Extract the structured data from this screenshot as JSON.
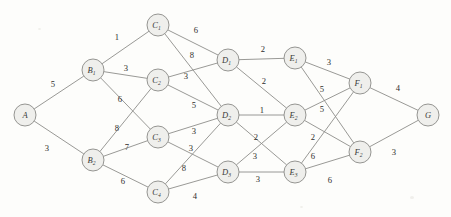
{
  "figure": {
    "background_color": "#fdfdfb",
    "node_fill_color": "#efefec",
    "node_stroke_color": "#8a8a87",
    "edge_color": "#8d8d8a",
    "label_color": "#2e2e2c",
    "width": 451,
    "height": 217
  },
  "chart_data": {
    "type": "diagram",
    "subtype": "weighted-undirected-graph",
    "title": "",
    "xlabel": "",
    "ylabel": "",
    "layers": [
      {
        "name": "source",
        "nodes": [
          "A"
        ]
      },
      {
        "name": "B",
        "nodes": [
          "B1",
          "B2"
        ]
      },
      {
        "name": "C",
        "nodes": [
          "C1",
          "C2",
          "C3",
          "C4"
        ]
      },
      {
        "name": "D",
        "nodes": [
          "D1",
          "D2",
          "D3"
        ]
      },
      {
        "name": "E",
        "nodes": [
          "E1",
          "E2",
          "E3"
        ]
      },
      {
        "name": "F",
        "nodes": [
          "F1",
          "F2"
        ]
      },
      {
        "name": "sink",
        "nodes": [
          "G"
        ]
      }
    ],
    "nodes": [
      {
        "id": "A",
        "base": "A",
        "sub": "",
        "x": 25,
        "y": 115,
        "r": 11
      },
      {
        "id": "B1",
        "base": "B",
        "sub": "1",
        "x": 93,
        "y": 70,
        "r": 11
      },
      {
        "id": "B2",
        "base": "B",
        "sub": "2",
        "x": 93,
        "y": 160,
        "r": 11
      },
      {
        "id": "C1",
        "base": "C",
        "sub": "1",
        "x": 158,
        "y": 25,
        "r": 11
      },
      {
        "id": "C2",
        "base": "C",
        "sub": "2",
        "x": 158,
        "y": 80,
        "r": 11
      },
      {
        "id": "C3",
        "base": "C",
        "sub": "3",
        "x": 158,
        "y": 137,
        "r": 11
      },
      {
        "id": "C4",
        "base": "C",
        "sub": "4",
        "x": 158,
        "y": 192,
        "r": 11
      },
      {
        "id": "D1",
        "base": "D",
        "sub": "1",
        "x": 228,
        "y": 60,
        "r": 11
      },
      {
        "id": "D2",
        "base": "D",
        "sub": "2",
        "x": 228,
        "y": 115,
        "r": 11
      },
      {
        "id": "D3",
        "base": "D",
        "sub": "3",
        "x": 228,
        "y": 172,
        "r": 11
      },
      {
        "id": "E1",
        "base": "E",
        "sub": "1",
        "x": 295,
        "y": 58,
        "r": 11
      },
      {
        "id": "E2",
        "base": "E",
        "sub": "2",
        "x": 295,
        "y": 115,
        "r": 11
      },
      {
        "id": "E3",
        "base": "E",
        "sub": "3",
        "x": 295,
        "y": 172,
        "r": 11
      },
      {
        "id": "F1",
        "base": "F",
        "sub": "1",
        "x": 360,
        "y": 83,
        "r": 11
      },
      {
        "id": "F2",
        "base": "F",
        "sub": "2",
        "x": 360,
        "y": 152,
        "r": 11
      },
      {
        "id": "G",
        "base": "G",
        "sub": "",
        "x": 428,
        "y": 115,
        "r": 11
      }
    ],
    "edges": [
      {
        "from": "A",
        "to": "B1",
        "weight": 5,
        "lx": 53,
        "ly": 84
      },
      {
        "from": "A",
        "to": "B2",
        "weight": 3,
        "lx": 47,
        "ly": 148
      },
      {
        "from": "B1",
        "to": "C1",
        "weight": 1,
        "lx": 117,
        "ly": 37
      },
      {
        "from": "B1",
        "to": "C2",
        "weight": 3,
        "lx": 126,
        "ly": 68
      },
      {
        "from": "B1",
        "to": "C3",
        "weight": 6,
        "lx": 120,
        "ly": 99
      },
      {
        "from": "B2",
        "to": "C2",
        "weight": 8,
        "lx": 117,
        "ly": 128
      },
      {
        "from": "B2",
        "to": "C3",
        "weight": 7,
        "lx": 127,
        "ly": 147
      },
      {
        "from": "B2",
        "to": "C4",
        "weight": 6,
        "lx": 123,
        "ly": 181
      },
      {
        "from": "C1",
        "to": "D1",
        "weight": 6,
        "lx": 196,
        "ly": 30
      },
      {
        "from": "C1",
        "to": "D2",
        "weight": 8,
        "lx": 192,
        "ly": 55
      },
      {
        "from": "C2",
        "to": "D1",
        "weight": 3,
        "lx": 186,
        "ly": 76
      },
      {
        "from": "C2",
        "to": "D2",
        "weight": 5,
        "lx": 194,
        "ly": 105
      },
      {
        "from": "C3",
        "to": "D2",
        "weight": 3,
        "lx": 194,
        "ly": 131
      },
      {
        "from": "C3",
        "to": "D3",
        "weight": 3,
        "lx": 191,
        "ly": 148
      },
      {
        "from": "C4",
        "to": "D2",
        "weight": 8,
        "lx": 184,
        "ly": 168
      },
      {
        "from": "C4",
        "to": "D3",
        "weight": 4,
        "lx": 195,
        "ly": 196
      },
      {
        "from": "D1",
        "to": "E1",
        "weight": 2,
        "lx": 263,
        "ly": 49
      },
      {
        "from": "D1",
        "to": "E2",
        "weight": 2,
        "lx": 264,
        "ly": 81
      },
      {
        "from": "D2",
        "to": "E2",
        "weight": 1,
        "lx": 262,
        "ly": 110
      },
      {
        "from": "D2",
        "to": "E3",
        "weight": 2,
        "lx": 256,
        "ly": 137
      },
      {
        "from": "D3",
        "to": "E2",
        "weight": 3,
        "lx": 255,
        "ly": 156
      },
      {
        "from": "D3",
        "to": "E3",
        "weight": 3,
        "lx": 258,
        "ly": 179
      },
      {
        "from": "E1",
        "to": "F1",
        "weight": 3,
        "lx": 329,
        "ly": 62
      },
      {
        "from": "E1",
        "to": "F2",
        "weight": 5,
        "lx": 322,
        "ly": 89
      },
      {
        "from": "E2",
        "to": "F1",
        "weight": 5,
        "lx": 322,
        "ly": 109
      },
      {
        "from": "E2",
        "to": "F2",
        "weight": 2,
        "lx": 313,
        "ly": 137
      },
      {
        "from": "E3",
        "to": "F1",
        "weight": 6,
        "lx": 313,
        "ly": 156
      },
      {
        "from": "E3",
        "to": "F2",
        "weight": 6,
        "lx": 330,
        "ly": 180
      },
      {
        "from": "F1",
        "to": "G",
        "weight": 4,
        "lx": 398,
        "ly": 88
      },
      {
        "from": "F2",
        "to": "G",
        "weight": 3,
        "lx": 394,
        "ly": 152
      }
    ]
  }
}
